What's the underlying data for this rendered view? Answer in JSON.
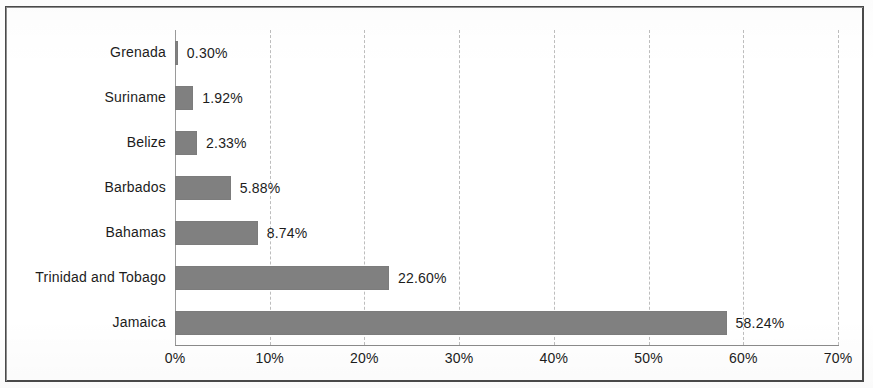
{
  "chart_data": {
    "type": "bar",
    "orientation": "horizontal",
    "title": "",
    "subtitle": "",
    "xlabel": "",
    "ylabel": "",
    "categories": [
      "Grenada",
      "Suriname",
      "Belize",
      "Barbados",
      "Bahamas",
      "Trinidad and Tobago",
      "Jamaica"
    ],
    "values": [
      0.3,
      1.92,
      2.33,
      5.88,
      8.74,
      22.6,
      58.24
    ],
    "data_labels": [
      "0.30%",
      "1.92%",
      "2.33%",
      "5.88%",
      "8.74%",
      "22.60%",
      "58.24%"
    ],
    "xlim": [
      0,
      70
    ],
    "xticks": [
      0,
      10,
      20,
      30,
      40,
      50,
      60,
      70
    ],
    "xtick_labels": [
      "0%",
      "10%",
      "20%",
      "30%",
      "40%",
      "50%",
      "60%",
      "70%"
    ],
    "grid": "vertical-dashed",
    "legend": "none",
    "series": [
      {
        "name": "Share",
        "values": [
          0.3,
          1.92,
          2.33,
          5.88,
          8.74,
          22.6,
          58.24
        ]
      }
    ],
    "colors": {
      "bar": "#808080",
      "gridline": "#bdbdbd",
      "axis": "#8a8a8a",
      "text": "#1c1c1c",
      "frame": "#4a4a4a",
      "background": "#ffffff"
    }
  }
}
